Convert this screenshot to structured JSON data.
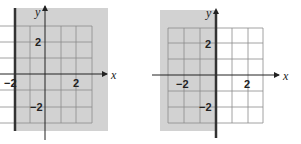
{
  "colors": {
    "shade": "#d2d2d2",
    "grid": "#8a8a8a",
    "axis": "#222222",
    "boundary": "#333333",
    "background": "#ffffff"
  },
  "graphs": [
    {
      "id": "left",
      "description": "Half-plane x >= -2 shaded; boundary line x = -2 (solid)",
      "axis_labels": {
        "x": "x",
        "y": "y"
      },
      "tick_labels": {
        "x_neg": "−2",
        "x_pos": "2",
        "y_pos": "2",
        "y_neg": "−2"
      },
      "boundary": "x = -2",
      "shaded_side": "right"
    },
    {
      "id": "right",
      "description": "Half-plane x <= 0 shaded; boundary line x = 0 (solid, on y-axis)",
      "axis_labels": {
        "x": "x",
        "y": "y"
      },
      "tick_labels": {
        "x_neg": "−2",
        "x_pos": "2",
        "y_pos": "2",
        "y_neg": "−2"
      },
      "boundary": "x = 0",
      "shaded_side": "left"
    }
  ]
}
